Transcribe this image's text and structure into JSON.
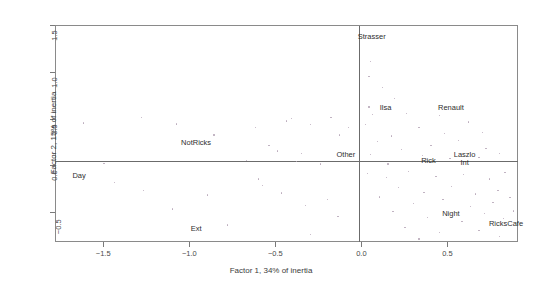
{
  "chart_data": {
    "type": "scatter",
    "title": "",
    "xlabel": "Factor 1, 34% of inertia",
    "ylabel": "Factor 2, 15% of inertia",
    "xlim": [
      -1.78,
      0.91
    ],
    "ylim": [
      -0.82,
      1.5
    ],
    "xticks": [
      -1.5,
      -1.0,
      -0.5,
      0.0,
      0.5
    ],
    "xticklabels": [
      "-1.5",
      "-1.0",
      "-0.5",
      "0.0",
      "0.5"
    ],
    "yticks": [
      1.5,
      1.0,
      0.5,
      0.0,
      -0.5
    ],
    "yticklabels": [
      "1.5",
      "1.0",
      "0.5",
      "0.0",
      "-0.5"
    ],
    "grid": false,
    "legend": "none",
    "reference_lines": {
      "h": 0.0,
      "v": 0.0
    },
    "labeled_points": [
      {
        "label": "Strasser",
        "x": 0.06,
        "y": 1.37
      },
      {
        "label": "Ilsa",
        "x": 0.14,
        "y": 0.61
      },
      {
        "label": "Renault",
        "x": 0.52,
        "y": 0.61
      },
      {
        "label": "Other",
        "x": -0.09,
        "y": 0.11
      },
      {
        "label": "Rick",
        "x": 0.39,
        "y": 0.05
      },
      {
        "label": "Laszlo",
        "x": 0.6,
        "y": 0.11
      },
      {
        "label": "Int",
        "x": 0.6,
        "y": 0.03
      },
      {
        "label": "NotRicks",
        "x": -0.96,
        "y": 0.24
      },
      {
        "label": "Day",
        "x": -1.64,
        "y": -0.11
      },
      {
        "label": "Ext",
        "x": -0.96,
        "y": -0.68
      },
      {
        "label": "Night",
        "x": 0.52,
        "y": -0.52
      },
      {
        "label": "RicksCafe",
        "x": 0.84,
        "y": -0.63
      }
    ],
    "scatter_points": [
      {
        "x": -1.62,
        "y": 0.46
      },
      {
        "x": -1.28,
        "y": 0.52
      },
      {
        "x": -1.08,
        "y": 0.45
      },
      {
        "x": -0.86,
        "y": 0.33
      },
      {
        "x": -0.62,
        "y": 0.41
      },
      {
        "x": -0.44,
        "y": 0.48
      },
      {
        "x": -0.41,
        "y": 0.51
      },
      {
        "x": -0.3,
        "y": 0.44
      },
      {
        "x": -0.18,
        "y": 0.52
      },
      {
        "x": -0.13,
        "y": 0.33
      },
      {
        "x": -0.08,
        "y": 0.41
      },
      {
        "x": -0.54,
        "y": 0.22
      },
      {
        "x": -0.49,
        "y": 0.16
      },
      {
        "x": -0.35,
        "y": 0.13
      },
      {
        "x": -0.67,
        "y": 0.06
      },
      {
        "x": -0.38,
        "y": 0.05
      },
      {
        "x": -0.24,
        "y": 0.02
      },
      {
        "x": -1.5,
        "y": 0.03
      },
      {
        "x": -1.44,
        "y": -0.18
      },
      {
        "x": -1.27,
        "y": -0.26
      },
      {
        "x": -0.6,
        "y": -0.14
      },
      {
        "x": -0.58,
        "y": -0.21
      },
      {
        "x": -0.47,
        "y": -0.29
      },
      {
        "x": -0.33,
        "y": -0.42
      },
      {
        "x": -0.2,
        "y": -0.36
      },
      {
        "x": -0.14,
        "y": -0.54
      },
      {
        "x": -0.78,
        "y": -0.63
      },
      {
        "x": -0.3,
        "y": -0.73
      },
      {
        "x": -1.1,
        "y": -0.46
      },
      {
        "x": -0.9,
        "y": -0.31
      },
      {
        "x": 0.05,
        "y": 1.12
      },
      {
        "x": 0.04,
        "y": 0.96
      },
      {
        "x": 0.12,
        "y": 0.84
      },
      {
        "x": 0.19,
        "y": 0.72
      },
      {
        "x": 0.04,
        "y": 0.63
      },
      {
        "x": 0.06,
        "y": 0.55
      },
      {
        "x": 0.26,
        "y": 0.56
      },
      {
        "x": 0.45,
        "y": 0.54
      },
      {
        "x": 0.62,
        "y": 0.47
      },
      {
        "x": 0.33,
        "y": 0.41
      },
      {
        "x": 0.17,
        "y": 0.32
      },
      {
        "x": 0.09,
        "y": 0.26
      },
      {
        "x": 0.05,
        "y": 0.12
      },
      {
        "x": 0.23,
        "y": 0.18
      },
      {
        "x": 0.4,
        "y": 0.22
      },
      {
        "x": 0.56,
        "y": 0.27
      },
      {
        "x": 0.72,
        "y": 0.19
      },
      {
        "x": 0.68,
        "y": 0.09
      },
      {
        "x": 0.8,
        "y": 0.13
      },
      {
        "x": 0.51,
        "y": 0.08
      },
      {
        "x": 0.35,
        "y": 0.11
      },
      {
        "x": 0.03,
        "y": -0.08
      },
      {
        "x": 0.14,
        "y": -0.12
      },
      {
        "x": 0.27,
        "y": -0.06
      },
      {
        "x": 0.43,
        "y": -0.11
      },
      {
        "x": 0.59,
        "y": -0.09
      },
      {
        "x": 0.74,
        "y": -0.14
      },
      {
        "x": 0.83,
        "y": -0.07
      },
      {
        "x": 0.21,
        "y": -0.23
      },
      {
        "x": 0.36,
        "y": -0.28
      },
      {
        "x": 0.52,
        "y": -0.22
      },
      {
        "x": 0.66,
        "y": -0.3
      },
      {
        "x": 0.79,
        "y": -0.26
      },
      {
        "x": 0.1,
        "y": -0.33
      },
      {
        "x": 0.3,
        "y": -0.4
      },
      {
        "x": 0.47,
        "y": -0.36
      },
      {
        "x": 0.63,
        "y": -0.43
      },
      {
        "x": 0.76,
        "y": -0.39
      },
      {
        "x": 0.86,
        "y": -0.34
      },
      {
        "x": 0.18,
        "y": -0.49
      },
      {
        "x": 0.38,
        "y": -0.55
      },
      {
        "x": 0.58,
        "y": -0.59
      },
      {
        "x": 0.71,
        "y": -0.51
      },
      {
        "x": 0.82,
        "y": -0.56
      },
      {
        "x": 0.25,
        "y": -0.66
      },
      {
        "x": 0.45,
        "y": -0.71
      },
      {
        "x": 0.68,
        "y": -0.69
      },
      {
        "x": 0.8,
        "y": -0.75
      },
      {
        "x": 0.33,
        "y": -0.78
      },
      {
        "x": 0.88,
        "y": -0.48
      },
      {
        "x": 0.15,
        "y": 0.02
      },
      {
        "x": 0.48,
        "y": 0.35
      },
      {
        "x": 0.7,
        "y": 0.36
      },
      {
        "x": 0.02,
        "y": 0.44
      }
    ]
  }
}
